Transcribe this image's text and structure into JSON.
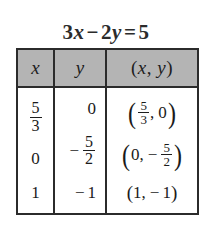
{
  "figure": {
    "name": "linear-equation-solution-table",
    "equation": {
      "coefficient_x": "3",
      "var_x": "x",
      "operator": "−",
      "coefficient_y": "2",
      "var_y": "y",
      "equals": "=",
      "constant": "5",
      "full_text": "3x − 2y = 5"
    },
    "colors": {
      "header_fill": "#b4b4b4",
      "border": "#2b2b2b",
      "text": "#1a1a1a",
      "background": "#ffffff"
    }
  },
  "table": {
    "headers": {
      "x": "x",
      "y": "y",
      "pair_open": "(",
      "pair_x": "x",
      "pair_comma": ",",
      "pair_y": "y",
      "pair_close": ")",
      "pair_full": "(x, y)"
    },
    "rows": [
      {
        "x": {
          "type": "fraction",
          "sign": "",
          "numerator": "5",
          "denominator": "3",
          "text": "5/3"
        },
        "y": {
          "type": "integer",
          "sign": "",
          "value": "0",
          "text": "0"
        },
        "pair": {
          "open": "(",
          "comma": ",",
          "close": ")",
          "text": "(5/3, 0)"
        }
      },
      {
        "x": {
          "type": "integer",
          "sign": "",
          "value": "0",
          "text": "0"
        },
        "y": {
          "type": "fraction",
          "sign": "−",
          "numerator": "5",
          "denominator": "2",
          "text": "−5/2"
        },
        "pair": {
          "open": "(",
          "comma": ",",
          "close": ")",
          "text": "(0, −5/2)"
        }
      },
      {
        "x": {
          "type": "integer",
          "sign": "",
          "value": "1",
          "text": "1"
        },
        "y": {
          "type": "integer",
          "sign": "−",
          "value": "1",
          "text": "−1"
        },
        "pair": {
          "open": "(",
          "comma": ",",
          "close": ")",
          "text": "(1, −1)"
        }
      }
    ]
  }
}
